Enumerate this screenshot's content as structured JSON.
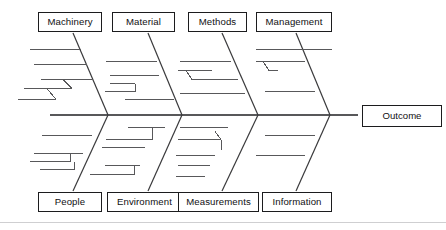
{
  "diagram": {
    "type": "fishbone-ishikawa-cause-and-effect",
    "title": "",
    "spine": {
      "x_start": 50,
      "x_end": 358,
      "y": 115,
      "arrow_to": "outcome"
    },
    "effect": {
      "label": "Outcome",
      "box": {
        "x": 362,
        "y": 105,
        "w": 80,
        "h": 22
      }
    },
    "top_categories": [
      {
        "label": "Machinery",
        "box": {
          "x": 38,
          "y": 12,
          "w": 64,
          "h": 20
        },
        "bone": {
          "x1": 73,
          "y1": 32,
          "x2": 108,
          "y2": 115
        },
        "sub_bones": 5
      },
      {
        "label": "Material",
        "box": {
          "x": 112,
          "y": 12,
          "w": 63,
          "h": 20
        },
        "bone": {
          "x1": 148,
          "y1": 32,
          "x2": 182,
          "y2": 115
        },
        "sub_bones": 5
      },
      {
        "label": "Methods",
        "box": {
          "x": 188,
          "y": 12,
          "w": 59,
          "h": 20
        },
        "bone": {
          "x1": 222,
          "y1": 32,
          "x2": 258,
          "y2": 115
        },
        "sub_bones": 4
      },
      {
        "label": "Management",
        "box": {
          "x": 256,
          "y": 12,
          "w": 76,
          "h": 20
        },
        "bone": {
          "x1": 296,
          "y1": 32,
          "x2": 330,
          "y2": 115
        },
        "sub_bones": 3
      }
    ],
    "bottom_categories": [
      {
        "label": "People",
        "box": {
          "x": 38,
          "y": 192,
          "w": 64,
          "h": 20
        },
        "bone": {
          "x1": 73,
          "y1": 192,
          "x2": 108,
          "y2": 115
        },
        "sub_bones": 4
      },
      {
        "label": "Environment",
        "box": {
          "x": 107,
          "y": 192,
          "w": 75,
          "h": 20
        },
        "bone": {
          "x1": 148,
          "y1": 192,
          "x2": 182,
          "y2": 115
        },
        "sub_bones": 5
      },
      {
        "label": "Measurements",
        "box": {
          "x": 178,
          "y": 192,
          "w": 81,
          "h": 20
        },
        "bone": {
          "x1": 222,
          "y1": 192,
          "x2": 258,
          "y2": 115
        },
        "sub_bones": 5
      },
      {
        "label": "Information",
        "box": {
          "x": 262,
          "y": 192,
          "w": 70,
          "h": 20
        },
        "bone": {
          "x1": 296,
          "y1": 192,
          "x2": 330,
          "y2": 115
        },
        "sub_bones": 2
      }
    ],
    "colors": {
      "background": "#ffffff",
      "box_border": "#1c1c1e",
      "text": "#101012",
      "bone_stroke": "#58585a",
      "main_bone_stroke": "#3a3a3c",
      "frame": "#cfcfd1"
    }
  }
}
